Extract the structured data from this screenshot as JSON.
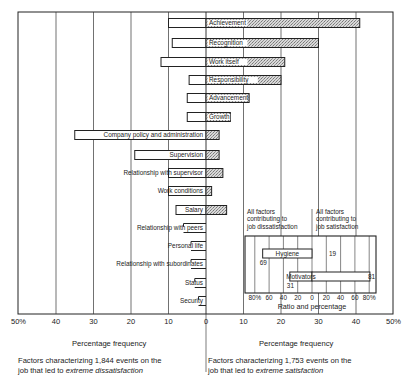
{
  "chart_data": {
    "type": "bar",
    "orientation": "horizontal-diverging",
    "title": "",
    "xlabel_left": "Percentage frequency",
    "xlabel_right": "Percentage frequency",
    "x_ticks_left": [
      "50%",
      "40",
      "30",
      "20",
      "10",
      "0"
    ],
    "x_ticks_right": [
      "10",
      "20",
      "30",
      "40",
      "50%"
    ],
    "xlim": [
      -50,
      50
    ],
    "grid": true,
    "categories": [
      "Achievement",
      "Recognition",
      "Work itself",
      "Responsibility",
      "Advancement",
      "Growth",
      "Company policy and administration",
      "Supervision",
      "Relationship with supervisor",
      "Work conditions",
      "Salary",
      "Relationship with peers",
      "Personal life",
      "Relationship with subordinates",
      "Status",
      "Security"
    ],
    "series": [
      {
        "name": "Dissatisfaction (left)",
        "values": [
          10,
          9,
          12,
          4.5,
          5,
          5,
          35,
          19,
          10,
          10,
          8,
          6,
          4,
          4,
          3,
          2
        ]
      },
      {
        "name": "Satisfaction (right)",
        "values": [
          41,
          30,
          21,
          20,
          11.5,
          6.5,
          3.5,
          3.5,
          4.5,
          1.5,
          5.5,
          0,
          0,
          0,
          0,
          0
        ]
      }
    ],
    "caption_left": {
      "line1": "Factors characterizing 1,844 events on the",
      "line2_prefix": "job that led to ",
      "line2_italic": "extreme dissatisfaction"
    },
    "caption_right": {
      "line1": "Factors characterizing 1,753 events on the",
      "line2_prefix": "job that led to ",
      "line2_italic": "extreme satisfaction"
    },
    "inset": {
      "type": "bar",
      "title_left": [
        "All factors",
        "contributing to",
        "job dissatisfaction"
      ],
      "title_right": [
        "All factors",
        "contributing to",
        "job satisfaction"
      ],
      "xlabel": "Ratio and percentage",
      "ticks": [
        "80%",
        "60",
        "40",
        "20",
        "0",
        "20",
        "40",
        "60",
        "80%"
      ],
      "categories": [
        "Hygiene",
        "Motivators"
      ],
      "left_values": [
        69,
        31
      ],
      "right_values": [
        19,
        81
      ],
      "left_labels": [
        "69",
        "31"
      ],
      "right_labels": [
        "19",
        "81"
      ]
    }
  }
}
